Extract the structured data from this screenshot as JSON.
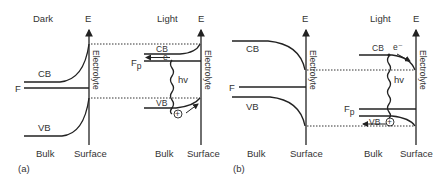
{
  "figure": {
    "panel_a": {
      "caption": "(a)",
      "dark": {
        "title": "Dark",
        "axis_label": "E",
        "conduction_band": "CB",
        "fermi_level": "F",
        "valence_band": "VB",
        "interface_label": "Electrolyte",
        "bulk_label": "Bulk",
        "surface_label": "Surface"
      },
      "light": {
        "title": "Light",
        "axis_label": "E",
        "conduction_band": "CB",
        "quasi_fermi_level": "Fp",
        "quasi_fermi_main": "F",
        "quasi_fermi_sub": "p",
        "electron": "e",
        "photon": "hv",
        "valence_band": "VB",
        "hole": "+",
        "interface_label": "Electrolyte",
        "bulk_label": "Bulk",
        "surface_label": "Surface"
      }
    },
    "panel_b": {
      "caption": "(b)",
      "dark": {
        "axis_label": "E",
        "conduction_band": "CB",
        "fermi_level": "F",
        "valence_band": "VB",
        "interface_label": "Electrolyte",
        "bulk_label": "Bulk",
        "surface_label": "Surface"
      },
      "light": {
        "title": "Light",
        "axis_label": "E",
        "conduction_band": "CB",
        "electron": "e⁻",
        "photon": "hv",
        "quasi_fermi_main": "F",
        "quasi_fermi_sub": "p",
        "valence_band": "VB",
        "hole": "+",
        "interface_label": "Electrolyte",
        "bulk_label": "Bulk",
        "surface_label": "Surface"
      }
    }
  }
}
